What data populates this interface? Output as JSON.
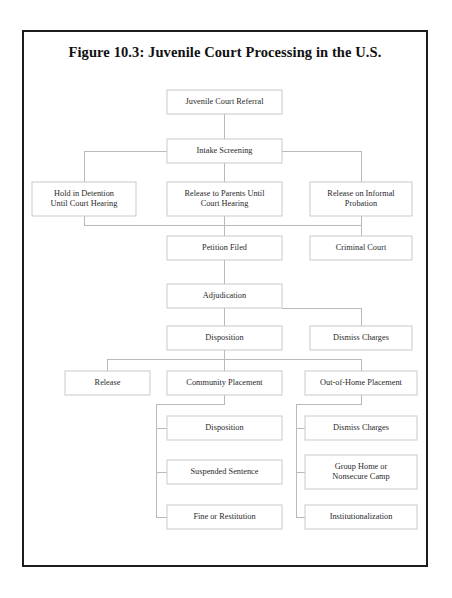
{
  "figure": {
    "title": "Figure 10.3: Juvenile Court Processing in the U.S."
  },
  "colors": {
    "page_border": "#1d1d1d",
    "box_border": "#c9c9c9",
    "connector": "#b9b9b9",
    "text": "#2a2a2a",
    "title_text": "#111111",
    "background": "#ffffff"
  },
  "chart_data": {
    "type": "diagram",
    "title": "Figure 10.3: Juvenile Court Processing in the U.S.",
    "nodes": [
      {
        "id": "juvenile-court-referral",
        "label": "Juvenile Court Referral",
        "lines": [
          "Juvenile Court Referral"
        ],
        "x": 167,
        "y": 90,
        "w": 115,
        "h": 24
      },
      {
        "id": "intake-screening",
        "label": "Intake Screening",
        "lines": [
          "Intake Screening"
        ],
        "x": 167,
        "y": 139,
        "w": 115,
        "h": 24
      },
      {
        "id": "hold-in-detention",
        "label": "Hold in Detention Until Court Hearing",
        "lines": [
          "Hold in Detention",
          "Until Court Hearing"
        ],
        "x": 32,
        "y": 182,
        "w": 104,
        "h": 34
      },
      {
        "id": "release-to-parents",
        "label": "Release to Parents Until Court Hearing",
        "lines": [
          "Release to Parents Until",
          "Court Hearing"
        ],
        "x": 167,
        "y": 182,
        "w": 115,
        "h": 34
      },
      {
        "id": "release-on-informal-probation",
        "label": "Release on Informal Probation",
        "lines": [
          "Release on Informal",
          "Probation"
        ],
        "x": 310,
        "y": 182,
        "w": 102,
        "h": 34
      },
      {
        "id": "petition-filed",
        "label": "Petition Filed",
        "lines": [
          "Petition Filed"
        ],
        "x": 167,
        "y": 236,
        "w": 115,
        "h": 24
      },
      {
        "id": "criminal-court",
        "label": "Criminal Court",
        "lines": [
          "Criminal Court"
        ],
        "x": 310,
        "y": 236,
        "w": 102,
        "h": 24
      },
      {
        "id": "adjudication",
        "label": "Adjudication",
        "lines": [
          "Adjudication"
        ],
        "x": 167,
        "y": 284,
        "w": 115,
        "h": 24
      },
      {
        "id": "disposition-1",
        "label": "Disposition",
        "lines": [
          "Disposition"
        ],
        "x": 167,
        "y": 326,
        "w": 115,
        "h": 24
      },
      {
        "id": "dismiss-charges-1",
        "label": "Dismiss Charges",
        "lines": [
          "Dismiss Charges"
        ],
        "x": 310,
        "y": 326,
        "w": 102,
        "h": 24
      },
      {
        "id": "release",
        "label": "Release",
        "lines": [
          "Release"
        ],
        "x": 65,
        "y": 371,
        "w": 85,
        "h": 24
      },
      {
        "id": "community-placement",
        "label": "Community Placement",
        "lines": [
          "Community Placement"
        ],
        "x": 167,
        "y": 371,
        "w": 115,
        "h": 24
      },
      {
        "id": "out-of-home-placement",
        "label": "Out-of-Home Placement",
        "lines": [
          "Out-of-Home Placement"
        ],
        "x": 305,
        "y": 371,
        "w": 112,
        "h": 24
      },
      {
        "id": "disposition-2",
        "label": "Disposition",
        "lines": [
          "Disposition"
        ],
        "x": 167,
        "y": 416,
        "w": 115,
        "h": 24
      },
      {
        "id": "dismiss-charges-2",
        "label": "Dismiss Charges",
        "lines": [
          "Dismiss Charges"
        ],
        "x": 305,
        "y": 416,
        "w": 112,
        "h": 24
      },
      {
        "id": "suspended-sentence",
        "label": "Suspended Sentence",
        "lines": [
          "Suspended Sentence"
        ],
        "x": 167,
        "y": 460,
        "w": 115,
        "h": 24
      },
      {
        "id": "group-home-or-nonsecure-camp",
        "label": "Group Home or Nonsecure Camp",
        "lines": [
          "Group Home or",
          "Nonsecure Camp"
        ],
        "x": 305,
        "y": 455,
        "w": 112,
        "h": 34
      },
      {
        "id": "fine-or-restitution",
        "label": "Fine or Restitution",
        "lines": [
          "Fine or Restitution"
        ],
        "x": 167,
        "y": 505,
        "w": 115,
        "h": 24
      },
      {
        "id": "institutionalization",
        "label": "Institutionalization",
        "lines": [
          "Institutionalization"
        ],
        "x": 305,
        "y": 505,
        "w": 112,
        "h": 24
      }
    ],
    "edges": [
      {
        "from": "juvenile-court-referral",
        "to": "intake-screening"
      },
      {
        "from": "intake-screening",
        "to": "hold-in-detention"
      },
      {
        "from": "intake-screening",
        "to": "release-to-parents"
      },
      {
        "from": "intake-screening",
        "to": "release-on-informal-probation"
      },
      {
        "from": "hold-in-detention",
        "to": "petition-filed"
      },
      {
        "from": "release-to-parents",
        "to": "petition-filed"
      },
      {
        "from": "release-on-informal-probation",
        "to": "petition-filed"
      },
      {
        "from": "petition-filed",
        "to": "criminal-court"
      },
      {
        "from": "petition-filed",
        "to": "adjudication"
      },
      {
        "from": "adjudication",
        "to": "disposition-1"
      },
      {
        "from": "adjudication",
        "to": "dismiss-charges-1"
      },
      {
        "from": "disposition-1",
        "to": "release"
      },
      {
        "from": "disposition-1",
        "to": "community-placement"
      },
      {
        "from": "disposition-1",
        "to": "out-of-home-placement"
      },
      {
        "from": "community-placement",
        "to": "disposition-2"
      },
      {
        "from": "community-placement",
        "to": "suspended-sentence"
      },
      {
        "from": "community-placement",
        "to": "fine-or-restitution"
      },
      {
        "from": "out-of-home-placement",
        "to": "dismiss-charges-2"
      },
      {
        "from": "out-of-home-placement",
        "to": "group-home-or-nonsecure-camp"
      },
      {
        "from": "out-of-home-placement",
        "to": "institutionalization"
      }
    ],
    "connector_paths": [
      "M224.5 114 L224.5 139",
      "M224.5 163 L224.5 182",
      "M167 151 L84 151 L84 182",
      "M282 151 L361 151 L361 182",
      "M84 216 L84 225 L361 225 L361 236",
      "M224.5 216 L224.5 236",
      "M361 216 L361 225",
      "M224.5 225 L224.5 236",
      "M224.5 260 L224.5 284",
      "M282 308 L361 308 L361 326",
      "M224.5 308 L224.5 326",
      "M224.5 350 L224.5 371",
      "M224.5 359 L107 359 L107 371",
      "M224.5 359 L361 359 L361 371",
      "M224.5 395 L224.5 404 L156 404 L156 517 L167 517",
      "M156 428 L167 428",
      "M156 472 L167 472",
      "M361 395 L361 404 L296 404 L296 517 L305 517",
      "M296 428 L305 428",
      "M296 472 L305 472"
    ]
  }
}
